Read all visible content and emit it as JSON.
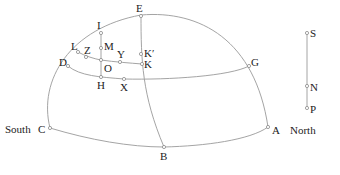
{
  "diagram": {
    "direction_labels": {
      "south": "South",
      "north": "North"
    },
    "points": [
      {
        "id": "E",
        "label": "E"
      },
      {
        "id": "I",
        "label": "I"
      },
      {
        "id": "L",
        "label": "L"
      },
      {
        "id": "Z",
        "label": "Z"
      },
      {
        "id": "M",
        "label": "M"
      },
      {
        "id": "Y",
        "label": "Y"
      },
      {
        "id": "Kp",
        "label": "K′"
      },
      {
        "id": "K",
        "label": "K"
      },
      {
        "id": "D",
        "label": "D"
      },
      {
        "id": "O",
        "label": "O"
      },
      {
        "id": "G",
        "label": "G"
      },
      {
        "id": "H",
        "label": "H"
      },
      {
        "id": "X",
        "label": "X"
      },
      {
        "id": "C",
        "label": "C"
      },
      {
        "id": "A",
        "label": "A"
      },
      {
        "id": "B",
        "label": "B"
      }
    ],
    "scale_bar": {
      "points": [
        {
          "id": "S",
          "label": "S"
        },
        {
          "id": "N",
          "label": "N"
        },
        {
          "id": "P",
          "label": "P"
        }
      ]
    }
  }
}
